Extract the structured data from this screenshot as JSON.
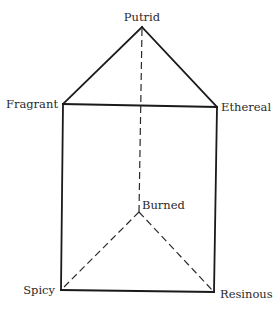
{
  "diagram": {
    "type": "odor-prism",
    "vertices": {
      "putrid": {
        "label": "Putrid",
        "x": 142,
        "y": 27
      },
      "fragrant": {
        "label": "Fragrant",
        "x": 63,
        "y": 104
      },
      "ethereal": {
        "label": "Ethereal",
        "x": 217,
        "y": 107
      },
      "burned": {
        "label": "Burned",
        "x": 139,
        "y": 212
      },
      "spicy": {
        "label": "Spicy",
        "x": 61,
        "y": 290
      },
      "resinous": {
        "label": "Resinous",
        "x": 214,
        "y": 292
      }
    },
    "solid_edges": [
      [
        "putrid",
        "fragrant"
      ],
      [
        "putrid",
        "ethereal"
      ],
      [
        "fragrant",
        "ethereal"
      ],
      [
        "fragrant",
        "spicy"
      ],
      [
        "ethereal",
        "resinous"
      ],
      [
        "spicy",
        "resinous"
      ]
    ],
    "dashed_edges": [
      [
        "putrid",
        "burned"
      ],
      [
        "burned",
        "spicy"
      ],
      [
        "burned",
        "resinous"
      ]
    ],
    "colors": {
      "line": "#1a1a1a",
      "text": "#2a2a2a",
      "background": "#ffffff"
    }
  }
}
